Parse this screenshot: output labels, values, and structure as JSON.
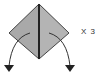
{
  "diagram": {
    "type": "origami-fold-step",
    "repeat_label": "X 3",
    "colors": {
      "paper": "#a9a9a9",
      "paper_edge": "#444444",
      "crease": "#222222",
      "arrow": "#222222",
      "background": "#ffffff"
    },
    "shape": {
      "top": [
        39,
        4
      ],
      "left": [
        9,
        33
      ],
      "right": [
        69,
        33
      ],
      "bottom": [
        39,
        59
      ]
    },
    "arrows": [
      {
        "name": "left-fold-arrow",
        "from": [
          30,
          33
        ],
        "to": [
          8,
          72
        ]
      },
      {
        "name": "right-fold-arrow",
        "from": [
          49,
          33
        ],
        "to": [
          71,
          72
        ]
      }
    ]
  }
}
